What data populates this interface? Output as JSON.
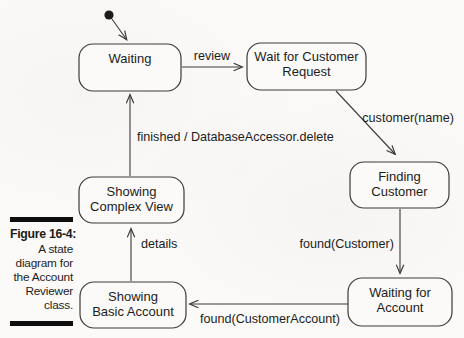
{
  "figure": {
    "label": "Figure 16-4:",
    "caption_lines": [
      "A state",
      "diagram for",
      "the Account",
      "Reviewer",
      "class."
    ]
  },
  "diagram": {
    "states": {
      "waiting": {
        "line1": "Waiting"
      },
      "wait_for_customer_request": {
        "line1": "Wait for Customer",
        "line2": "Request"
      },
      "finding_customer": {
        "line1": "Finding",
        "line2": "Customer"
      },
      "waiting_for_account": {
        "line1": "Waiting for",
        "line2": "Account"
      },
      "showing_complex_view": {
        "line1": "Showing",
        "line2": "Complex View"
      },
      "showing_basic_account": {
        "line1": "Showing",
        "line2": "Basic Account"
      }
    },
    "transitions": {
      "review": "review",
      "customer_name": "customer(name)",
      "found_customer": "found(Customer)",
      "found_customer_account": "found(CustomerAccount)",
      "details": "details",
      "finished": "finished / DatabaseAccessor.delete"
    }
  },
  "theme": {
    "paper": "#fbfaf8",
    "line": "#3a3a3a",
    "ink": "#1c1c1c",
    "caption-bar": "#0d0d0d"
  }
}
